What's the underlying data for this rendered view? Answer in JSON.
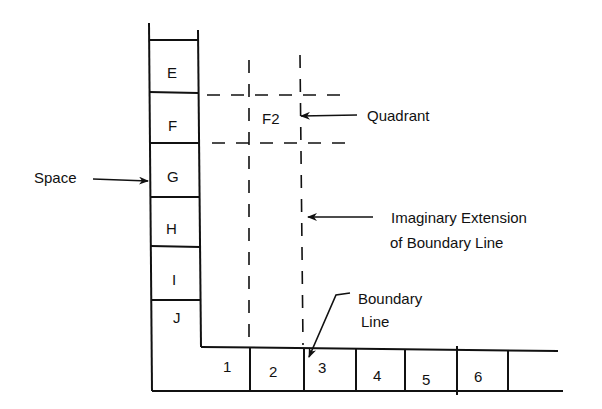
{
  "diagram": {
    "colors": {
      "ink": "#111111",
      "background": "#ffffff"
    },
    "column_cells": [
      {
        "label": "E",
        "x": 172,
        "y": 73
      },
      {
        "label": "F",
        "x": 172,
        "y": 126
      },
      {
        "label": "G",
        "x": 174,
        "y": 177
      },
      {
        "label": "H",
        "x": 172,
        "y": 229
      },
      {
        "label": "I",
        "x": 174,
        "y": 280
      },
      {
        "label": "J",
        "x": 177,
        "y": 323
      }
    ],
    "row_cells": [
      {
        "label": "1",
        "x": 227,
        "y": 370
      },
      {
        "label": "2",
        "x": 274,
        "y": 376
      },
      {
        "label": "3",
        "x": 324,
        "y": 372
      },
      {
        "label": "4",
        "x": 378,
        "y": 380
      },
      {
        "label": "5",
        "x": 427,
        "y": 384
      },
      {
        "label": "6",
        "x": 479,
        "y": 381
      }
    ],
    "quadrant_cell": {
      "label": "F2"
    },
    "callouts": {
      "space": "Space",
      "quadrant": "Quadrant",
      "imaginary_line1": "Imaginary Extension",
      "imaginary_line2": "of Boundary  Line",
      "boundary_line1": "Boundary",
      "boundary_line2": "Line"
    },
    "icons": {
      "space_arrow": "arrow-right-icon",
      "quadrant_arrow": "arrow-left-icon",
      "imaginary_arrow": "arrow-left-icon",
      "boundary_arrow": "arrow-down-left-icon"
    }
  }
}
